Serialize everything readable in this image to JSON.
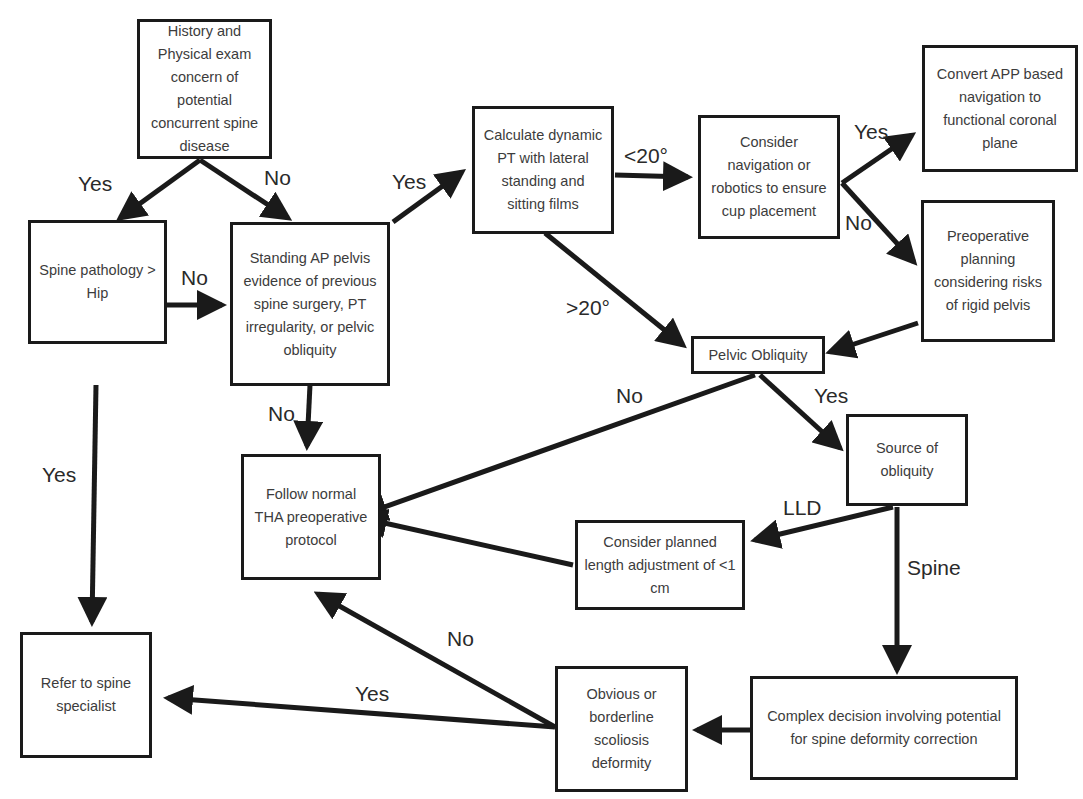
{
  "nodes": {
    "history": "History and Physical exam concern of potential concurrent spine disease",
    "spine_pathology": "Spine pathology > Hip",
    "standing_ap": "Standing AP pelvis evidence of previous spine surgery, PT irregularity, or pelvic obliquity",
    "calculate_pt": "Calculate dynamic PT with lateral standing and sitting films",
    "consider_navigation": "Consider navigation or robotics to ensure cup placement",
    "convert_app": "Convert APP based navigation to functional coronal plane",
    "preop_planning": "Preoperative planning considering risks of rigid pelvis",
    "pelvic_obliquity": "Pelvic Obliquity",
    "follow_normal": "Follow normal THA preoperative protocol",
    "source_obliquity": "Source of obliquity",
    "consider_length": "Consider planned length adjustment of <1 cm",
    "refer_specialist": "Refer to spine specialist",
    "obvious_scoliosis": "Obvious or borderline scoliosis deformity",
    "complex_decision": "Complex decision involving potential for spine deformity correction"
  },
  "edge_labels": {
    "history_yes": "Yes",
    "history_no": "No",
    "spine_no": "No",
    "spine_yes": "Yes",
    "standing_yes": "Yes",
    "standing_no": "No",
    "pt_lt20": "<20°",
    "pt_gt20": ">20°",
    "nav_yes": "Yes",
    "nav_no": "No",
    "obliquity_no": "No",
    "obliquity_yes": "Yes",
    "source_lld": "LLD",
    "source_spine": "Spine",
    "scoliosis_no": "No",
    "scoliosis_yes": "Yes"
  },
  "colors": {
    "stroke": "#1a1a1a",
    "text": "#3c3c3c",
    "background": "#ffffff"
  }
}
